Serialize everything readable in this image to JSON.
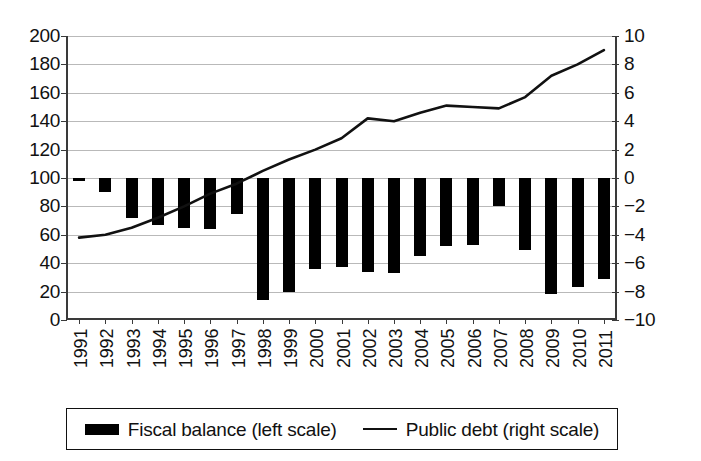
{
  "chart_data": {
    "type": "bar",
    "title": "",
    "subtitle": "",
    "xlabel": "",
    "ylabel": "",
    "grid": true,
    "legend_position": "bottom",
    "categories": [
      "1991",
      "1992",
      "1993",
      "1994",
      "1995",
      "1996",
      "1997",
      "1998",
      "1999",
      "2000",
      "2001",
      "2002",
      "2003",
      "2004",
      "2005",
      "2006",
      "2007",
      "2008",
      "2009",
      "2010",
      "2011"
    ],
    "axes": {
      "left": {
        "label": "",
        "ylim": [
          0,
          200
        ],
        "tick_step": 20,
        "ticks": [
          "0",
          "20",
          "40",
          "60",
          "80",
          "100",
          "120",
          "140",
          "160",
          "180",
          "200"
        ],
        "series": "Public debt (right scale)"
      },
      "right": {
        "label": "",
        "ylim": [
          -10,
          10
        ],
        "tick_step": 2,
        "ticks": [
          "-10",
          "-8",
          "-6",
          "-4",
          "-2",
          "0",
          "2",
          "4",
          "6",
          "8",
          "10"
        ],
        "series": "Fiscal balance (left scale)"
      }
    },
    "series": [
      {
        "name": "Fiscal balance (left scale)",
        "type": "bar",
        "axis": "right",
        "unit": "percent of GDP",
        "color": "#000000",
        "values": [
          -0.1,
          -1.0,
          -2.8,
          -3.3,
          -3.5,
          -3.6,
          -2.5,
          -8.6,
          -8.0,
          -6.4,
          -6.3,
          -6.6,
          -6.7,
          -5.5,
          -4.8,
          -4.7,
          -2.0,
          -5.1,
          -8.2,
          -7.7,
          -7.1
        ]
      },
      {
        "name": "Public debt (right scale)",
        "type": "line",
        "axis": "left",
        "unit": "percent of GDP",
        "color": "#111111",
        "values": [
          58,
          60,
          65,
          72,
          80,
          89,
          96,
          105,
          113,
          120,
          128,
          142,
          140,
          146,
          151,
          150,
          149,
          157,
          172,
          180,
          190
        ]
      }
    ]
  },
  "legend": {
    "items": [
      {
        "label": "Fiscal balance (left scale)",
        "marker": "bar-swatch"
      },
      {
        "label": "Public debt (right scale)",
        "marker": "line-swatch"
      }
    ]
  }
}
